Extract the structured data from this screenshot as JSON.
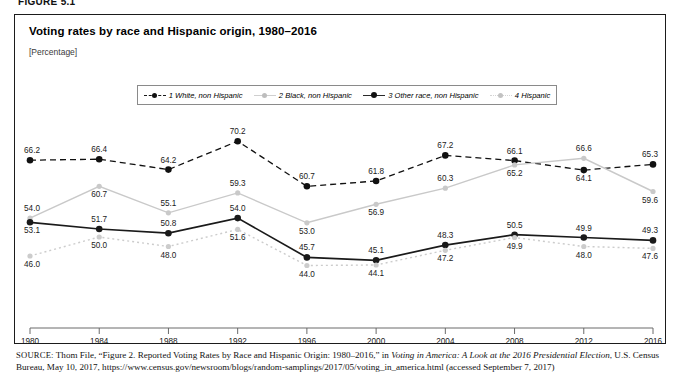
{
  "figure": {
    "label": "FIGURE 5.1"
  },
  "chart": {
    "title": "Voting rates by race and Hispanic origin, 1980–2016",
    "subtitle": "[Percentage]"
  },
  "legend": {
    "items": [
      {
        "label": "1 White, non Hispanic",
        "marker": "dashed-black-dot",
        "color": "#111111"
      },
      {
        "label": "2 Black, non Hispanic",
        "marker": "solid-lightgray-dot",
        "color": "#c9c9c9"
      },
      {
        "label": "3 Other race, non Hispanic",
        "marker": "solid-black-dot",
        "color": "#1a1a1a"
      },
      {
        "label": "4 Hispanic",
        "marker": "dotted-lightgray-dot",
        "color": "#cccccc"
      }
    ]
  },
  "source": {
    "keyword": "SOURCE:",
    "line1_a": " Thom File, “Figure 2. Reported Voting Rates by Race and Hispanic Origin: 1980–2016,” in ",
    "line1_italic": "Voting in America: A Look at the 2016 Presidential Election",
    "line2_a": ", U.S. Census Bureau, May 10, 2017, https://www.census.gov/newsroom/blogs/random-samplings/2017/05/voting_in_america.html (accessed September 7, 2017)"
  },
  "chart_data": {
    "type": "line",
    "title": "Voting rates by race and Hispanic origin, 1980–2016",
    "subtitle": "[Percentage]",
    "xlabel": "",
    "ylabel": "Percentage",
    "x": [
      1980,
      1984,
      1988,
      1992,
      1996,
      2000,
      2004,
      2008,
      2012,
      2016
    ],
    "categories": [
      "1980",
      "1984",
      "1988",
      "1992",
      "1996",
      "2000",
      "2004",
      "2008",
      "2012",
      "2016"
    ],
    "ylim": [
      40,
      72
    ],
    "grid": false,
    "legend_position": "top",
    "axis": {
      "x_visible": true,
      "y_visible": false,
      "ticks_below": true
    },
    "series": [
      {
        "name": "1 White, non Hispanic",
        "color": "#111111",
        "style": "dashed",
        "values": [
          66.2,
          66.4,
          64.2,
          70.2,
          60.7,
          61.8,
          67.2,
          66.1,
          64.1,
          65.3
        ],
        "label_pos": [
          "above",
          "above",
          "above",
          "above",
          "above",
          "above",
          "above",
          "above",
          "below",
          "above"
        ]
      },
      {
        "name": "2 Black, non Hispanic",
        "color": "#c9c9c9",
        "style": "solid",
        "values": [
          54.0,
          60.7,
          55.1,
          59.3,
          53.0,
          56.9,
          60.3,
          65.2,
          66.6,
          59.6
        ],
        "label_pos": [
          "above",
          "below",
          "above",
          "above",
          "below",
          "below",
          "above",
          "below",
          "above",
          "below"
        ]
      },
      {
        "name": "3 Other race, non Hispanic",
        "color": "#1a1a1a",
        "style": "solid",
        "values": [
          53.1,
          51.7,
          50.8,
          54.0,
          45.7,
          45.1,
          48.3,
          50.5,
          49.9,
          49.3
        ],
        "label_pos": [
          "below",
          "above",
          "above",
          "above",
          "above",
          "above",
          "above",
          "above",
          "above",
          "above"
        ]
      },
      {
        "name": "4 Hispanic",
        "color": "#cccccc",
        "style": "dotted",
        "values": [
          46.0,
          50.0,
          48.0,
          51.6,
          44.0,
          44.1,
          47.2,
          49.9,
          48.0,
          47.6
        ],
        "label_pos": [
          "below",
          "below",
          "below",
          "below",
          "below",
          "below",
          "below",
          "below",
          "below",
          "below"
        ]
      }
    ]
  }
}
